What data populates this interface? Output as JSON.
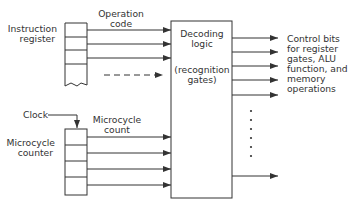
{
  "diagram": {
    "instruction_register": {
      "label_line1": "Instruction",
      "label_line2": "register"
    },
    "operation_code": {
      "label_line1": "Operation",
      "label_line2": "code"
    },
    "decoding_logic": {
      "line1": "Decoding",
      "line2": "logic",
      "line3": "(recognition",
      "line4": "gates)"
    },
    "clock": {
      "label": "Clock"
    },
    "microcycle_counter": {
      "label_line1": "Microcycle",
      "label_line2": "counter"
    },
    "microcycle_count": {
      "label_line1": "Microcycle",
      "label_line2": "count"
    },
    "outputs": {
      "line1": "Control bits",
      "line2": "for register",
      "line3": "gates, ALU",
      "line4": "function, and",
      "line5": "memory",
      "line6": "operations"
    },
    "colors": {
      "line": "#333333",
      "background": "#ffffff"
    }
  }
}
